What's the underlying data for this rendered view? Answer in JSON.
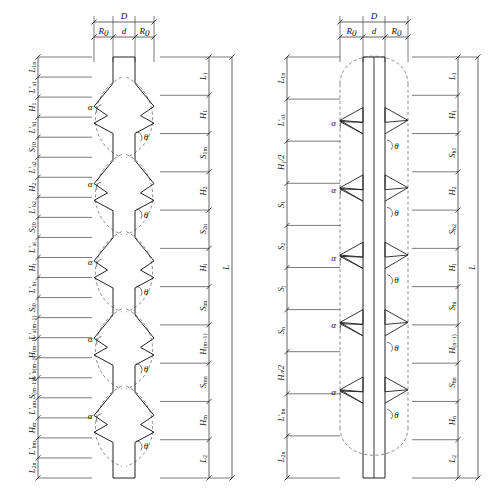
{
  "figure": {
    "background_color": "#ffffff",
    "line_color": "#222222",
    "dashed_color": "#444444",
    "angle_symbols": {
      "alpha": "α",
      "theta": "θ"
    }
  },
  "diagrams": [
    {
      "id": "left-diagram",
      "name": "tapered-corrugated-shaft",
      "shaft_style": "corrugated",
      "top_dimensions": {
        "total": {
          "symbol": "D",
          "sub": ""
        },
        "parts": [
          {
            "symbol": "R",
            "sub": "0"
          },
          {
            "symbol": "d",
            "sub": ""
          },
          {
            "symbol": "R",
            "sub": "0"
          }
        ]
      },
      "left_labels": [
        {
          "symbol": "L",
          "sub": "1n"
        },
        {
          "symbol": "L′",
          "sub": "a1"
        },
        {
          "symbol": "H",
          "sub": "1"
        },
        {
          "symbol": "L′",
          "sub": "b1"
        },
        {
          "symbol": "S",
          "sub": "10"
        },
        {
          "symbol": "L′",
          "sub": "a2"
        },
        {
          "symbol": "H",
          "sub": "2"
        },
        {
          "symbol": "L′",
          "sub": "b2"
        },
        {
          "symbol": "S",
          "sub": "20"
        },
        {
          "symbol": "L′",
          "sub": "ai"
        },
        {
          "symbol": "H",
          "sub": "i"
        },
        {
          "symbol": "L′",
          "sub": "bi"
        },
        {
          "symbol": "S",
          "sub": "i0"
        },
        {
          "symbol": "L′",
          "sub": "a(m−1)"
        },
        {
          "symbol": "H",
          "sub": "(m−1)"
        },
        {
          "symbol": "L′",
          "sub": "b(m−1)"
        },
        {
          "symbol": "S",
          "sub": "(m−1)0"
        },
        {
          "symbol": "L′",
          "sub": "am"
        },
        {
          "symbol": "H",
          "sub": "m"
        },
        {
          "symbol": "L′",
          "sub": "bm"
        },
        {
          "symbol": "L",
          "sub": "2n"
        }
      ],
      "right_labels": [
        {
          "symbol": "L",
          "sub": "1"
        },
        {
          "symbol": "H",
          "sub": "1"
        },
        {
          "symbol": "S",
          "sub": "1m"
        },
        {
          "symbol": "H",
          "sub": "2"
        },
        {
          "symbol": "S",
          "sub": "2n"
        },
        {
          "symbol": "H",
          "sub": "i"
        },
        {
          "symbol": "S",
          "sub": "im"
        },
        {
          "symbol": "H",
          "sub": "(m−1)"
        },
        {
          "symbol": "S",
          "sub": "mn"
        },
        {
          "symbol": "H",
          "sub": "m"
        },
        {
          "symbol": "L",
          "sub": "2"
        }
      ],
      "overall_label": {
        "symbol": "L",
        "sub": ""
      },
      "angle_labels": [
        {
          "symbol": "α",
          "side": "left"
        },
        {
          "symbol": "θ",
          "side": "right"
        }
      ],
      "bulge_count": 5
    },
    {
      "id": "right-diagram",
      "name": "straight-shaft-with-fins",
      "shaft_style": "straight",
      "top_dimensions": {
        "total": {
          "symbol": "D",
          "sub": ""
        },
        "parts": [
          {
            "symbol": "R",
            "sub": "0"
          },
          {
            "symbol": "d",
            "sub": ""
          },
          {
            "symbol": "R",
            "sub": "0"
          }
        ]
      },
      "left_labels": [
        {
          "symbol": "L",
          "sub": "1n"
        },
        {
          "symbol": "L′",
          "sub": "a1"
        },
        {
          "symbol": "H₁/2",
          "sub": ""
        },
        {
          "symbol": "S",
          "sub": "1"
        },
        {
          "symbol": "S",
          "sub": "2"
        },
        {
          "symbol": "S",
          "sub": "j"
        },
        {
          "symbol": "S",
          "sub": "n"
        },
        {
          "symbol": "Hₙ/2",
          "sub": ""
        },
        {
          "symbol": "L′",
          "sub": "bn"
        },
        {
          "symbol": "L",
          "sub": "2n"
        }
      ],
      "right_labels": [
        {
          "symbol": "L",
          "sub": "1"
        },
        {
          "symbol": "H",
          "sub": "1"
        },
        {
          "symbol": "S",
          "sub": "h1"
        },
        {
          "symbol": "H",
          "sub": "2"
        },
        {
          "symbol": "S",
          "sub": "h2"
        },
        {
          "symbol": "H",
          "sub": "i"
        },
        {
          "symbol": "S",
          "sub": "hi"
        },
        {
          "symbol": "H",
          "sub": "(n−1)"
        },
        {
          "symbol": "S",
          "sub": "hn"
        },
        {
          "symbol": "H",
          "sub": "n"
        },
        {
          "symbol": "L",
          "sub": "2"
        }
      ],
      "overall_label": {
        "symbol": "L",
        "sub": ""
      },
      "angle_labels": [
        {
          "symbol": "α",
          "side": "left"
        },
        {
          "symbol": "θ",
          "side": "right"
        }
      ],
      "fin_count": 5
    }
  ]
}
